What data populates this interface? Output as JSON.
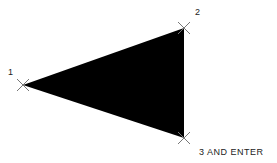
{
  "diagram": {
    "shape": "filled-triangle",
    "fill_color": "#000000",
    "marker_color": "#777777",
    "vertices": [
      {
        "id": 1,
        "x": 23,
        "y": 85,
        "label": "1"
      },
      {
        "id": 2,
        "x": 184,
        "y": 28,
        "label": "2"
      },
      {
        "id": 3,
        "x": 184,
        "y": 138,
        "label": "3 AND ENTER"
      }
    ]
  }
}
